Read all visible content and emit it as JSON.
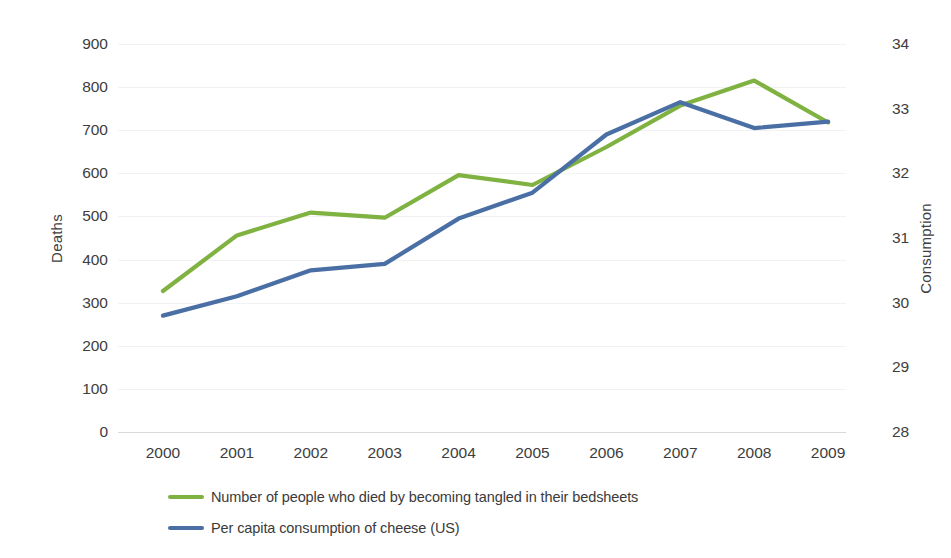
{
  "chart_data": {
    "type": "line",
    "title": "",
    "xlabel": "",
    "categories": [
      "2000",
      "2001",
      "2002",
      "2003",
      "2004",
      "2005",
      "2006",
      "2007",
      "2008",
      "2009"
    ],
    "grid": true,
    "legend_position": "bottom",
    "axes": {
      "left": {
        "label": "Deaths",
        "ticks": [
          "900",
          "800",
          "700",
          "600",
          "500",
          "400",
          "300",
          "200",
          "100",
          "0"
        ],
        "ylim": [
          0,
          900
        ],
        "step": 100
      },
      "right": {
        "label": "Consumption",
        "ticks": [
          "34",
          "33",
          "32",
          "31",
          "30",
          "29",
          "28"
        ],
        "ylim": [
          28,
          34
        ],
        "step": 1
      }
    },
    "series": [
      {
        "name": "Number of people who died by becoming tangled in their bedsheets",
        "axis": "left",
        "color": "#7FB241",
        "values": [
          327,
          456,
          509,
          497,
          596,
          573,
          661,
          757,
          815,
          718
        ]
      },
      {
        "name": "Per capita consumption of cheese (US)",
        "axis": "right",
        "color": "#4A6FA5",
        "values": [
          29.8,
          30.1,
          30.5,
          30.6,
          31.3,
          31.7,
          32.6,
          33.1,
          32.7,
          32.8
        ]
      }
    ]
  }
}
